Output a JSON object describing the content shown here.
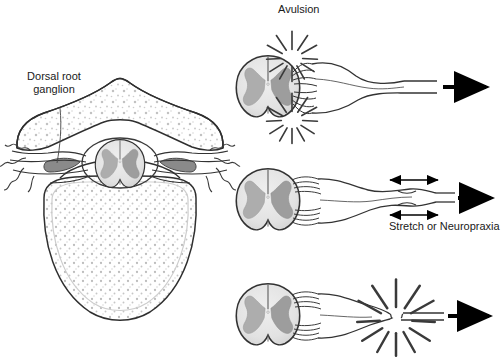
{
  "figure": {
    "width": 504,
    "height": 363,
    "background": "#ffffff"
  },
  "labels": {
    "dorsal_root_ganglion": "Dorsal root\nganglion",
    "avulsion": "Avulsion",
    "stretch_or_neuropraxia": "Stretch or Neuropraxia",
    "rupture": ""
  },
  "colors": {
    "outline": "#2b2b2b",
    "white_matter": "#e6e6e6",
    "gray_matter": "#a9a9a9",
    "ganglion_fill": "#8c8c8c",
    "bone_fill": "#fdfdfd",
    "stipple": "#b8b8b8",
    "burst_line": "#3a3a3a",
    "arrow": "#000000",
    "text": "#1a1a1a"
  },
  "panels": [
    {
      "id": "vertebra-cross-section",
      "name": "Vertebral cross section with spinal cord",
      "position": "left",
      "label": "Dorsal root\nganglion",
      "features": [
        "spinous process",
        "laminae",
        "vertebral body with trabecular stipple",
        "spinal cord cross section",
        "dorsal root ganglion",
        "exiting nerve branches"
      ]
    },
    {
      "id": "avulsion",
      "name": "Avulsion injury",
      "position": "top-right",
      "label": "Avulsion",
      "burst_count": 2,
      "has_arrow": true,
      "description": "Nerve rootlets torn directly from the spinal cord at both dorsal and ventral attachment points"
    },
    {
      "id": "stretch",
      "name": "Stretch or neuropraxia injury",
      "position": "middle-right",
      "label": "Stretch or Neuropraxia",
      "burst_count": 0,
      "double_arrows": 2,
      "has_arrow": true,
      "description": "Nerve remains in continuity but is elongated and narrowed"
    },
    {
      "id": "rupture",
      "name": "Rupture injury",
      "position": "bottom-right",
      "label": "",
      "burst_count": 1,
      "has_arrow": true,
      "description": "Nerve torn across its width distal to the spinal cord"
    }
  ]
}
